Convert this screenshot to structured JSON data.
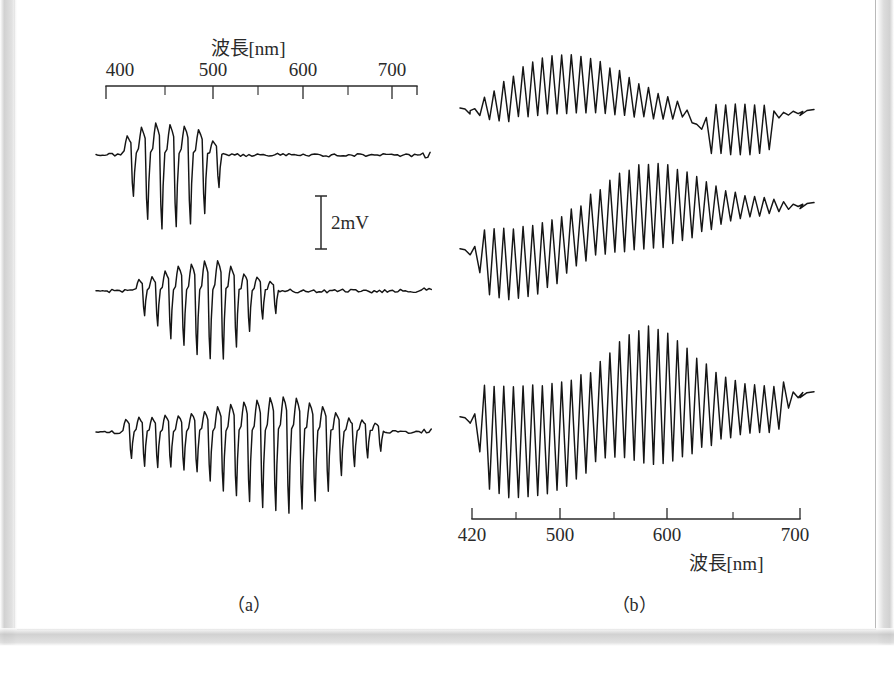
{
  "figure": {
    "kind": "electrophysiology-spectral-response-figure",
    "panels": [
      {
        "id": "a",
        "caption": "（a）"
      },
      {
        "id": "b",
        "caption": "（b）"
      }
    ]
  },
  "scalebar": {
    "label": "2mV",
    "value": 2,
    "unit": "mV"
  },
  "chart_data": [
    {
      "id": "panel-a",
      "type": "line",
      "title": "",
      "caption": "（a）",
      "xlabel": "波長[nm]",
      "ylabel": "",
      "xlim": [
        385,
        720
      ],
      "axis_position": "top",
      "grid": false,
      "legend": "none",
      "tick_labels": [
        "400",
        "500",
        "600",
        "700"
      ],
      "tick_values": [
        400,
        500,
        600,
        700
      ],
      "minor_tick_values": [
        450,
        550,
        650
      ],
      "scalebar": {
        "label": "2mV",
        "value": 2,
        "unit": "mV"
      },
      "series": [
        {
          "name": "trace-a1",
          "description": "short-wavelength (blue) sensitive response, peak near 450 nm",
          "peak_nm": 450,
          "envelope": [
            {
              "x": 392,
              "amp": 0.1
            },
            {
              "x": 405,
              "amp": 0.12
            },
            {
              "x": 415,
              "amp": 0.6
            },
            {
              "x": 428,
              "amp": 0.88
            },
            {
              "x": 440,
              "amp": 1.0
            },
            {
              "x": 452,
              "amp": 0.97
            },
            {
              "x": 465,
              "amp": 0.95
            },
            {
              "x": 478,
              "amp": 0.88
            },
            {
              "x": 492,
              "amp": 0.7
            },
            {
              "x": 505,
              "amp": 0.3
            },
            {
              "x": 520,
              "amp": 0.17
            },
            {
              "x": 545,
              "amp": 0.13
            },
            {
              "x": 575,
              "amp": 0.1
            },
            {
              "x": 620,
              "amp": 0.11
            },
            {
              "x": 665,
              "amp": 0.1
            },
            {
              "x": 710,
              "amp": 0.1
            }
          ]
        },
        {
          "name": "trace-a2",
          "description": "mid-wavelength (green) sensitive response, peak near 505 nm",
          "peak_nm": 505,
          "envelope": [
            {
              "x": 392,
              "amp": 0.1
            },
            {
              "x": 405,
              "amp": 0.14
            },
            {
              "x": 420,
              "amp": 0.3
            },
            {
              "x": 435,
              "amp": 0.46
            },
            {
              "x": 450,
              "amp": 0.66
            },
            {
              "x": 465,
              "amp": 0.8
            },
            {
              "x": 480,
              "amp": 0.92
            },
            {
              "x": 495,
              "amp": 1.0
            },
            {
              "x": 508,
              "amp": 0.98
            },
            {
              "x": 520,
              "amp": 0.8
            },
            {
              "x": 535,
              "amp": 0.55
            },
            {
              "x": 550,
              "amp": 0.38
            },
            {
              "x": 568,
              "amp": 0.22
            },
            {
              "x": 595,
              "amp": 0.14
            },
            {
              "x": 640,
              "amp": 0.12
            },
            {
              "x": 690,
              "amp": 0.13
            },
            {
              "x": 712,
              "amp": 0.11
            }
          ]
        },
        {
          "name": "trace-a3",
          "description": "broadband response with maximum near 580 nm",
          "peak_nm": 580,
          "envelope": [
            {
              "x": 392,
              "amp": 0.1
            },
            {
              "x": 404,
              "amp": 0.14
            },
            {
              "x": 416,
              "amp": 0.4
            },
            {
              "x": 432,
              "amp": 0.42
            },
            {
              "x": 448,
              "amp": 0.44
            },
            {
              "x": 462,
              "amp": 0.46
            },
            {
              "x": 478,
              "amp": 0.5
            },
            {
              "x": 492,
              "amp": 0.6
            },
            {
              "x": 508,
              "amp": 0.74
            },
            {
              "x": 522,
              "amp": 0.82
            },
            {
              "x": 538,
              "amp": 0.9
            },
            {
              "x": 552,
              "amp": 0.96
            },
            {
              "x": 568,
              "amp": 1.0
            },
            {
              "x": 582,
              "amp": 0.99
            },
            {
              "x": 596,
              "amp": 0.86
            },
            {
              "x": 612,
              "amp": 0.72
            },
            {
              "x": 630,
              "amp": 0.5
            },
            {
              "x": 652,
              "amp": 0.3
            },
            {
              "x": 678,
              "amp": 0.17
            },
            {
              "x": 706,
              "amp": 0.14
            }
          ]
        }
      ]
    },
    {
      "id": "panel-b",
      "type": "line",
      "title": "",
      "caption": "（b）",
      "xlabel": "波長[nm]",
      "ylabel": "",
      "xlim": [
        415,
        715
      ],
      "axis_position": "bottom",
      "grid": false,
      "legend": "none",
      "tick_labels": [
        "420",
        "500",
        "600",
        "700"
      ],
      "tick_values": [
        420,
        500,
        600,
        700
      ],
      "minor_tick_values": [
        460,
        550,
        650
      ],
      "series": [
        {
          "name": "trace-b1",
          "description": "hyperpolarizing cell: baseline drops through mid spectrum, steps up past 620 nm",
          "baseline": [
            {
              "x": 418,
              "y": 0.0
            },
            {
              "x": 432,
              "y": 0.06
            },
            {
              "x": 448,
              "y": 0.18
            },
            {
              "x": 466,
              "y": 0.34
            },
            {
              "x": 486,
              "y": 0.44
            },
            {
              "x": 506,
              "y": 0.46
            },
            {
              "x": 528,
              "y": 0.42
            },
            {
              "x": 548,
              "y": 0.32
            },
            {
              "x": 570,
              "y": 0.18
            },
            {
              "x": 592,
              "y": 0.06
            },
            {
              "x": 612,
              "y": -0.02
            },
            {
              "x": 622,
              "y": -0.26
            },
            {
              "x": 640,
              "y": -0.28
            },
            {
              "x": 686,
              "y": -0.28
            },
            {
              "x": 700,
              "y": -0.06
            },
            {
              "x": 712,
              "y": -0.04
            }
          ],
          "envelope": [
            {
              "x": 418,
              "amp": 0.02
            },
            {
              "x": 430,
              "amp": 0.22
            },
            {
              "x": 450,
              "amp": 0.4
            },
            {
              "x": 475,
              "amp": 0.52
            },
            {
              "x": 500,
              "amp": 0.56
            },
            {
              "x": 525,
              "amp": 0.52
            },
            {
              "x": 550,
              "amp": 0.42
            },
            {
              "x": 575,
              "amp": 0.3
            },
            {
              "x": 600,
              "amp": 0.2
            },
            {
              "x": 616,
              "amp": 0.04
            },
            {
              "x": 628,
              "amp": 0.04
            },
            {
              "x": 636,
              "amp": 0.46
            },
            {
              "x": 660,
              "amp": 0.48
            },
            {
              "x": 686,
              "amp": 0.46
            },
            {
              "x": 698,
              "amp": 0.04
            },
            {
              "x": 712,
              "amp": 0.02
            }
          ]
        },
        {
          "name": "trace-b2",
          "description": "depolarizing cell: baseline rises from short to long wavelengths, envelope peak near 575 nm",
          "baseline": [
            {
              "x": 418,
              "y": -0.28
            },
            {
              "x": 432,
              "y": -0.4
            },
            {
              "x": 452,
              "y": -0.42
            },
            {
              "x": 472,
              "y": -0.38
            },
            {
              "x": 492,
              "y": -0.26
            },
            {
              "x": 512,
              "y": -0.06
            },
            {
              "x": 532,
              "y": 0.14
            },
            {
              "x": 552,
              "y": 0.28
            },
            {
              "x": 572,
              "y": 0.36
            },
            {
              "x": 596,
              "y": 0.38
            },
            {
              "x": 620,
              "y": 0.36
            },
            {
              "x": 648,
              "y": 0.34
            },
            {
              "x": 680,
              "y": 0.33
            },
            {
              "x": 712,
              "y": 0.33
            }
          ],
          "envelope": [
            {
              "x": 418,
              "amp": 0.06
            },
            {
              "x": 430,
              "amp": 0.52
            },
            {
              "x": 450,
              "amp": 0.56
            },
            {
              "x": 472,
              "amp": 0.56
            },
            {
              "x": 492,
              "amp": 0.52
            },
            {
              "x": 512,
              "amp": 0.46
            },
            {
              "x": 532,
              "amp": 0.52
            },
            {
              "x": 552,
              "amp": 0.62
            },
            {
              "x": 572,
              "amp": 0.68
            },
            {
              "x": 592,
              "amp": 0.66
            },
            {
              "x": 612,
              "amp": 0.54
            },
            {
              "x": 632,
              "amp": 0.38
            },
            {
              "x": 652,
              "amp": 0.24
            },
            {
              "x": 672,
              "amp": 0.16
            },
            {
              "x": 692,
              "amp": 0.12
            },
            {
              "x": 706,
              "amp": 0.05
            },
            {
              "x": 712,
              "amp": 0.02
            }
          ]
        },
        {
          "name": "trace-b3",
          "description": "broadband cell: strong oscillation across whole range, baseline step up near 540 nm, envelope peak near 580 nm",
          "baseline": [
            {
              "x": 418,
              "y": -0.16
            },
            {
              "x": 434,
              "y": -0.34
            },
            {
              "x": 456,
              "y": -0.38
            },
            {
              "x": 478,
              "y": -0.36
            },
            {
              "x": 500,
              "y": -0.3
            },
            {
              "x": 520,
              "y": -0.18
            },
            {
              "x": 538,
              "y": 0.02
            },
            {
              "x": 556,
              "y": 0.14
            },
            {
              "x": 576,
              "y": 0.18
            },
            {
              "x": 598,
              "y": 0.14
            },
            {
              "x": 620,
              "y": 0.06
            },
            {
              "x": 644,
              "y": 0.0
            },
            {
              "x": 670,
              "y": -0.02
            },
            {
              "x": 696,
              "y": -0.02
            },
            {
              "x": 706,
              "y": 0.1
            },
            {
              "x": 712,
              "y": 0.12
            }
          ],
          "envelope": [
            {
              "x": 418,
              "amp": 0.06
            },
            {
              "x": 430,
              "amp": 0.7
            },
            {
              "x": 450,
              "amp": 0.76
            },
            {
              "x": 470,
              "amp": 0.76
            },
            {
              "x": 492,
              "amp": 0.74
            },
            {
              "x": 512,
              "amp": 0.7
            },
            {
              "x": 530,
              "amp": 0.64
            },
            {
              "x": 546,
              "amp": 0.74
            },
            {
              "x": 562,
              "amp": 0.86
            },
            {
              "x": 578,
              "amp": 0.94
            },
            {
              "x": 594,
              "amp": 0.9
            },
            {
              "x": 610,
              "amp": 0.76
            },
            {
              "x": 628,
              "amp": 0.58
            },
            {
              "x": 648,
              "amp": 0.42
            },
            {
              "x": 668,
              "amp": 0.34
            },
            {
              "x": 688,
              "amp": 0.32
            },
            {
              "x": 702,
              "amp": 0.28
            },
            {
              "x": 710,
              "amp": 0.04
            }
          ]
        }
      ]
    }
  ]
}
